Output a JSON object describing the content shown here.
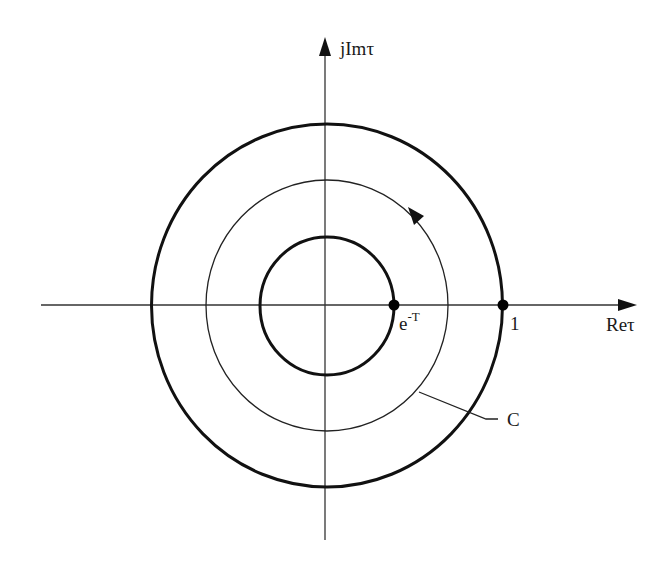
{
  "diagram": {
    "type": "complex-plane-contour",
    "colors": {
      "stroke": "#1a1a1a",
      "axis": "#333333",
      "background": "#ffffff"
    },
    "axes": {
      "horizontal": {
        "label_main": "Re",
        "label_sym": "τ",
        "label": "Reτ"
      },
      "vertical": {
        "label_main": "jIm",
        "label_sym": "τ",
        "label": "jImτ"
      }
    },
    "circles": [
      {
        "name": "outer-unit-circle",
        "description": "unit circle, radius 1",
        "weight": "thick"
      },
      {
        "name": "contour-C",
        "description": "contour C, traversed counter-clockwise",
        "weight": "thin"
      },
      {
        "name": "inner-circle",
        "description": "circle of radius e^-T",
        "weight": "thick"
      }
    ],
    "points": [
      {
        "name": "point-e-minus-T",
        "label_base": "e",
        "label_sup": "-T",
        "label": "e^-T"
      },
      {
        "name": "point-one",
        "label": "1"
      }
    ],
    "contour_label": "C",
    "direction_arrow": "counter-clockwise"
  }
}
